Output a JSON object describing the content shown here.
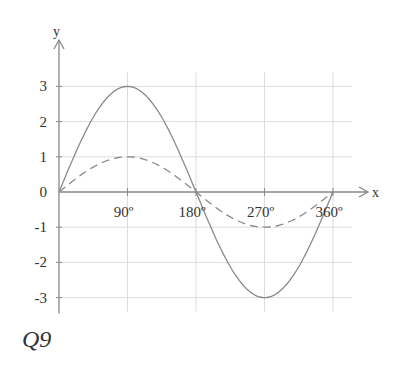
{
  "caption": "Q9",
  "chart_data": {
    "type": "line",
    "title": "",
    "xlabel": "x",
    "ylabel": "y",
    "x_ticks": [
      "90º",
      "180º",
      "270º",
      "360º"
    ],
    "x_tick_values": [
      90,
      180,
      270,
      360
    ],
    "y_ticks": [
      "3",
      "2",
      "1",
      "0",
      "-1",
      "-2",
      "-3"
    ],
    "y_tick_values": [
      3,
      2,
      1,
      0,
      -1,
      -2,
      -3
    ],
    "xlim": [
      0,
      360
    ],
    "ylim": [
      -3,
      3
    ],
    "grid": true,
    "legend": null,
    "series": [
      {
        "name": "y = 3 sin x",
        "style": "solid",
        "color": "#8a8a8a",
        "x": [
          0,
          45,
          90,
          135,
          180,
          225,
          270,
          315,
          360
        ],
        "values": [
          0,
          2.12,
          3,
          2.12,
          0,
          -2.12,
          -3,
          -2.12,
          0
        ]
      },
      {
        "name": "y = sin x",
        "style": "dashed",
        "color": "#8a8a8a",
        "x": [
          0,
          45,
          90,
          135,
          180,
          225,
          270,
          315,
          360
        ],
        "values": [
          0,
          0.71,
          1,
          0.71,
          0,
          -0.71,
          -1,
          -0.71,
          0
        ]
      }
    ]
  },
  "colors": {
    "axis": "#888888",
    "grid": "#dddddd",
    "curve": "#8a8a8a",
    "text": "#333333"
  }
}
